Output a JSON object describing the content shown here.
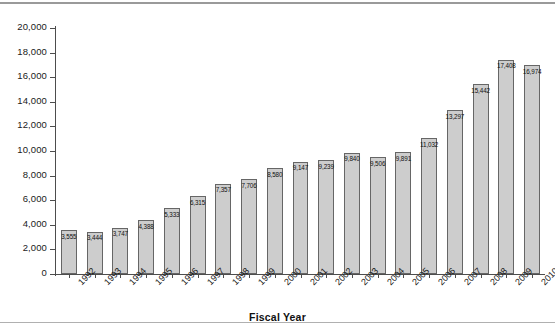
{
  "chart_data": {
    "type": "bar",
    "title": "",
    "xlabel": "Fiscal Year",
    "ylabel": "",
    "ylim": [
      0,
      20000
    ],
    "ytick_labels": [
      "20,000",
      "18,000",
      "16,000",
      "14,000",
      "12,000",
      "10,000",
      "8,000",
      "6,000",
      "4,000",
      "2,000",
      "0"
    ],
    "ytick_values": [
      20000,
      18000,
      16000,
      14000,
      12000,
      10000,
      8000,
      6000,
      4000,
      2000,
      0
    ],
    "grid": false,
    "legend": "none",
    "categories": [
      "1992",
      "1993",
      "1994",
      "1995",
      "1996",
      "1997",
      "1998",
      "1999",
      "2000",
      "2001",
      "2002",
      "2003",
      "2004",
      "2005",
      "2006",
      "2007",
      "2008",
      "2009",
      "2010"
    ],
    "values": [
      3555,
      3444,
      3747,
      4388,
      5333,
      6315,
      7357,
      7706,
      8580,
      9147,
      9239,
      9840,
      9506,
      9891,
      11032,
      13297,
      15442,
      17408,
      16974
    ],
    "value_labels": [
      "3,555",
      "3,444",
      "3,747",
      "4,388",
      "5,333",
      "6,315",
      "7,357",
      "7,706",
      "8,580",
      "9,147",
      "9,239",
      "9,840",
      "9,506",
      "9,891",
      "11,032",
      "13,297",
      "15,442",
      "17,408",
      "16,974"
    ],
    "bar_fill_color": "#cdcdcd",
    "bar_border_color": "#666666",
    "axis_color": "#4d4d4d",
    "text_color": "#1a1a1a"
  }
}
